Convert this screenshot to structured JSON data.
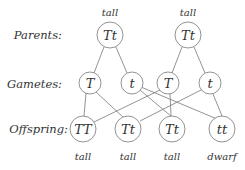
{
  "diagram": {
    "row_labels": {
      "parents": "Parents:",
      "gametes": "Gametes:",
      "offspring": "Offspring:"
    },
    "parents": [
      {
        "genotype": "Tt",
        "phenotype": "tall"
      },
      {
        "genotype": "Tt",
        "phenotype": "tall"
      }
    ],
    "gametes": [
      {
        "allele": "T",
        "parent": 0
      },
      {
        "allele": "t",
        "parent": 0
      },
      {
        "allele": "T",
        "parent": 1
      },
      {
        "allele": "t",
        "parent": 1
      }
    ],
    "offspring": [
      {
        "genotype": "TT",
        "phenotype": "tall"
      },
      {
        "genotype": "Tt",
        "phenotype": "tall"
      },
      {
        "genotype": "Tt",
        "phenotype": "tall"
      },
      {
        "genotype": "tt",
        "phenotype": "dwarf"
      }
    ],
    "colors": {
      "line": "#666666",
      "text": "#333333"
    }
  }
}
